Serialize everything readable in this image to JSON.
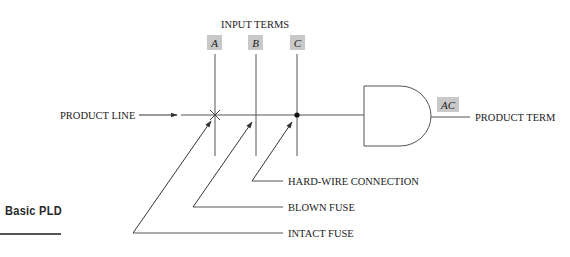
{
  "section": {
    "title": "Basic PLD"
  },
  "diagram": {
    "input_header": "INPUT TERMS",
    "inputs": [
      {
        "label": "A",
        "state": "intact fuse"
      },
      {
        "label": "B",
        "state": "blown fuse"
      },
      {
        "label": "C",
        "state": "hard-wire connection"
      }
    ],
    "product_line_label": "PRODUCT LINE",
    "gate": {
      "type": "AND",
      "output_label": "AC"
    },
    "product_term_label": "PRODUCT TERM",
    "callouts": {
      "hard_wire": "HARD-WIRE CONNECTION",
      "blown_fuse": "BLOWN FUSE",
      "intact_fuse": "INTACT FUSE"
    },
    "colors": {
      "line": "#555555",
      "label_box": "#c8c8c8",
      "text": "#222222"
    }
  }
}
